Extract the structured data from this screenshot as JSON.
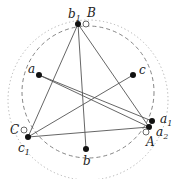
{
  "diagram": {
    "title": "",
    "colors": {
      "line": "#555555",
      "dashed_circle": "#777777",
      "dotted_circle": "#aaaaaa",
      "filled_point": "#111111",
      "open_point_stroke": "#444444"
    },
    "points": [
      {
        "id": "b1",
        "label": "b",
        "sub": "1",
        "x": 78,
        "y": 24,
        "type": "filled"
      },
      {
        "id": "B",
        "label": "B",
        "sub": "",
        "x": 86,
        "y": 24,
        "type": "open"
      },
      {
        "id": "a",
        "label": "a",
        "sub": "",
        "x": 39,
        "y": 75,
        "type": "filled"
      },
      {
        "id": "c",
        "label": "c",
        "sub": "",
        "x": 133,
        "y": 75,
        "type": "filled"
      },
      {
        "id": "C",
        "label": "C",
        "sub": "",
        "x": 24,
        "y": 130,
        "type": "open"
      },
      {
        "id": "c1",
        "label": "c",
        "sub": "1",
        "x": 28,
        "y": 137,
        "type": "filled"
      },
      {
        "id": "b",
        "label": "b",
        "sub": "",
        "x": 86,
        "y": 149,
        "type": "filled"
      },
      {
        "id": "a1",
        "label": "a",
        "sub": "1",
        "x": 152,
        "y": 121,
        "type": "filled"
      },
      {
        "id": "a2",
        "label": "a",
        "sub": "2",
        "x": 149,
        "y": 127,
        "type": "filled"
      },
      {
        "id": "A",
        "label": "A",
        "sub": "",
        "x": 146,
        "y": 132,
        "type": "open"
      }
    ],
    "segments": [
      [
        "b1",
        "c1"
      ],
      [
        "b1",
        "b"
      ],
      [
        "b1",
        "a2"
      ],
      [
        "c1",
        "a2"
      ],
      [
        "c",
        "c1"
      ],
      [
        "a",
        "a1"
      ],
      [
        "a",
        "a2"
      ]
    ],
    "labels": {
      "b1": "b",
      "b1_sub": "1",
      "B": "B",
      "a": "a",
      "c": "c",
      "C": "C",
      "c1": "c",
      "c1_sub": "1",
      "b": "b",
      "a1": "a",
      "a1_sub": "1",
      "a2": "a",
      "a2_sub": "2",
      "A": "A"
    }
  }
}
